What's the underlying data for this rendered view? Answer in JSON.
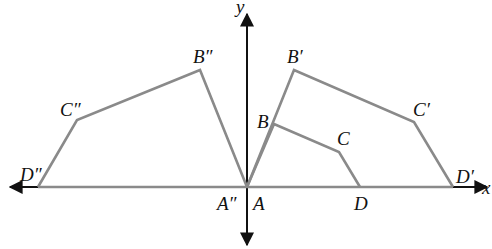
{
  "diagram": {
    "type": "coordinate-geometry-dilation-reflection",
    "axes": {
      "x_label": "x",
      "y_label": "y"
    },
    "colors": {
      "polygon_stroke": "#8a8a8a",
      "axis": "#111111",
      "background": "#ffffff"
    },
    "points": {
      "A": {
        "label": "A",
        "px": [
          247,
          187
        ]
      },
      "B": {
        "label": "B",
        "px": [
          274,
          124
        ]
      },
      "C": {
        "label": "C",
        "px": [
          339,
          152
        ]
      },
      "D": {
        "label": "D",
        "px": [
          360,
          187
        ]
      },
      "B1": {
        "label": "B′",
        "px": [
          294,
          70
        ]
      },
      "C1": {
        "label": "C′",
        "px": [
          414,
          122
        ]
      },
      "D1": {
        "label": "D′",
        "px": [
          453,
          187
        ]
      },
      "A2": {
        "label": "A″",
        "px": [
          247,
          187
        ]
      },
      "B2": {
        "label": "B″",
        "px": [
          200,
          70
        ]
      },
      "C2": {
        "label": "C″",
        "px": [
          77,
          120
        ]
      },
      "D2": {
        "label": "D″",
        "px": [
          38,
          187
        ]
      }
    },
    "polygons": [
      {
        "name": "ABCD",
        "vertices": [
          "A",
          "B",
          "C",
          "D"
        ]
      },
      {
        "name": "A'B'C'D'",
        "vertices": [
          "A",
          "B1",
          "C1",
          "D1"
        ]
      },
      {
        "name": "A''B''C''D''",
        "vertices": [
          "A2",
          "B2",
          "C2",
          "D2"
        ]
      }
    ]
  }
}
